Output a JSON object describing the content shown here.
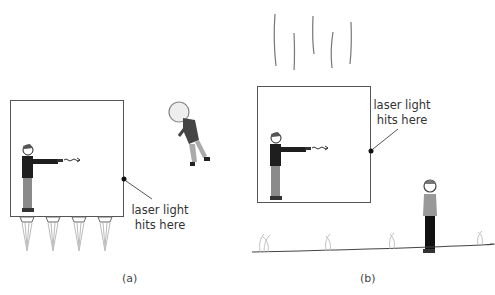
{
  "figure": {
    "panel_a": {
      "caption": "(a)",
      "annotation_line1": "laser light",
      "annotation_line2": "hits here",
      "description": "Box accelerated by rocket engines in space; observer inside fires laser horizontally; floating astronaut outside."
    },
    "panel_b": {
      "caption": "(b)",
      "annotation_line1": "laser light",
      "annotation_line2": "hits here",
      "description": "Box in free fall near ground; observer inside fires laser horizontally; person standing on ground outside."
    },
    "colors": {
      "outline": "#555555",
      "figure_dark": "#222222",
      "figure_gray": "#8a8a8a",
      "background": "#ffffff"
    }
  }
}
